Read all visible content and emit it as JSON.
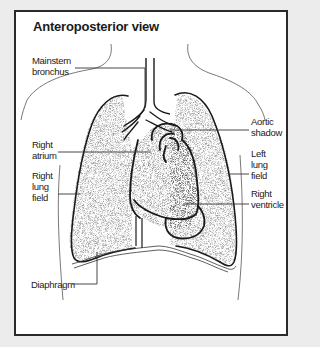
{
  "title": "Anteroposterior view",
  "labels": {
    "mainstem_bronchus": [
      "Mainstem",
      "bronchus"
    ],
    "right_atrium": [
      "Right",
      "atrium"
    ],
    "right_lung_field": [
      "Right",
      "lung",
      "field"
    ],
    "diaphragm": [
      "Diaphragm"
    ],
    "aortic_shadow": [
      "Aortic",
      "shadow"
    ],
    "left_lung_field": [
      "Left",
      "lung",
      "field"
    ],
    "right_ventricle": [
      "Right",
      "ventricle"
    ]
  },
  "colors": {
    "background": "#ececec",
    "panel": "#ffffff",
    "border": "#2a2a2a",
    "ink": "#1a1a1a",
    "stipple": "#7a7a7a"
  }
}
